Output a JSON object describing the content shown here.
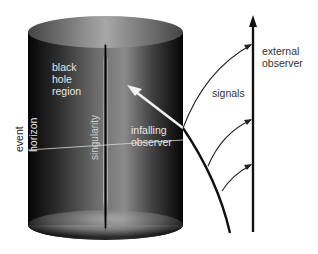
{
  "diagram": {
    "labels": {
      "black_hole_region": [
        "black",
        "hole",
        "region"
      ],
      "event": "event",
      "horizon": "horizon",
      "singularity": "singularity",
      "infalling_observer": [
        "infalling",
        "observer"
      ],
      "signals": "signals",
      "external_observer": [
        "external",
        "observer"
      ]
    },
    "colors": {
      "background": "#ffffff",
      "cylinder_dark": "#0a0a0a",
      "cylinder_mid": "#6a6a6a",
      "cylinder_light": "#b8b8b8",
      "worldline": "#111111",
      "inside_text": "#e8e8e8",
      "outside_text": "#222222"
    }
  }
}
